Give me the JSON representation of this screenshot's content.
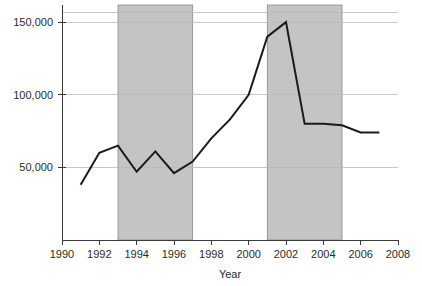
{
  "chart_data": {
    "type": "line",
    "title": "",
    "xlabel": "Year",
    "ylabel": "",
    "x": [
      1991,
      1992,
      1993,
      1994,
      1995,
      1996,
      1997,
      1998,
      1999,
      2000,
      2001,
      2002,
      2003,
      2004,
      2005,
      2006,
      2007
    ],
    "values": [
      38000,
      60000,
      65000,
      47000,
      61000,
      46000,
      54000,
      70000,
      83000,
      100000,
      140000,
      150000,
      80000,
      80000,
      79000,
      74000,
      74000
    ],
    "series": [
      {
        "name": "",
        "values": [
          38000,
          60000,
          65000,
          47000,
          61000,
          46000,
          54000,
          70000,
          83000,
          100000,
          140000,
          150000,
          80000,
          80000,
          79000,
          74000,
          74000
        ]
      }
    ],
    "xlim": [
      1990,
      2008
    ],
    "ylim": [
      0,
      157000
    ],
    "xticks": [
      1990,
      1992,
      1994,
      1996,
      1998,
      2000,
      2002,
      2004,
      2006,
      2008
    ],
    "xtick_labels": [
      "1990",
      "1992",
      "1994",
      "1996",
      "1998",
      "2000",
      "2002",
      "2004",
      "2006",
      "2008"
    ],
    "yticks": [
      50000,
      100000,
      150000
    ],
    "ytick_labels": [
      "50,000",
      "100,000",
      "150,000"
    ],
    "grid": true,
    "grid_axis": "y",
    "legend": false,
    "shaded_regions": [
      {
        "label": "",
        "x_start": 1993,
        "x_end": 1997
      },
      {
        "label": "",
        "x_start": 2001,
        "x_end": 2005
      }
    ],
    "colors": {
      "line": "#1a1a1a",
      "shade_fill": "#c4c4c4",
      "shade_stroke": "#8a8a8a",
      "grid": "#b9b9b9",
      "axis": "#3a3a3a",
      "text": "#2b2b2b",
      "background": "#ffffff"
    }
  }
}
